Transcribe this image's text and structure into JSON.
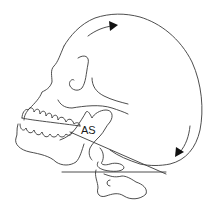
{
  "diagram": {
    "labels": {
      "as": "AS"
    },
    "arrows": [
      {
        "name": "upper-rotation-arrow",
        "direction": "clockwise",
        "position": "crown"
      },
      {
        "name": "posterior-rotation-arrow",
        "direction": "downward",
        "position": "occiput"
      }
    ],
    "colors": {
      "line": "#3a3a3a",
      "arrowhead": "#111111",
      "background": "#ffffff"
    }
  }
}
